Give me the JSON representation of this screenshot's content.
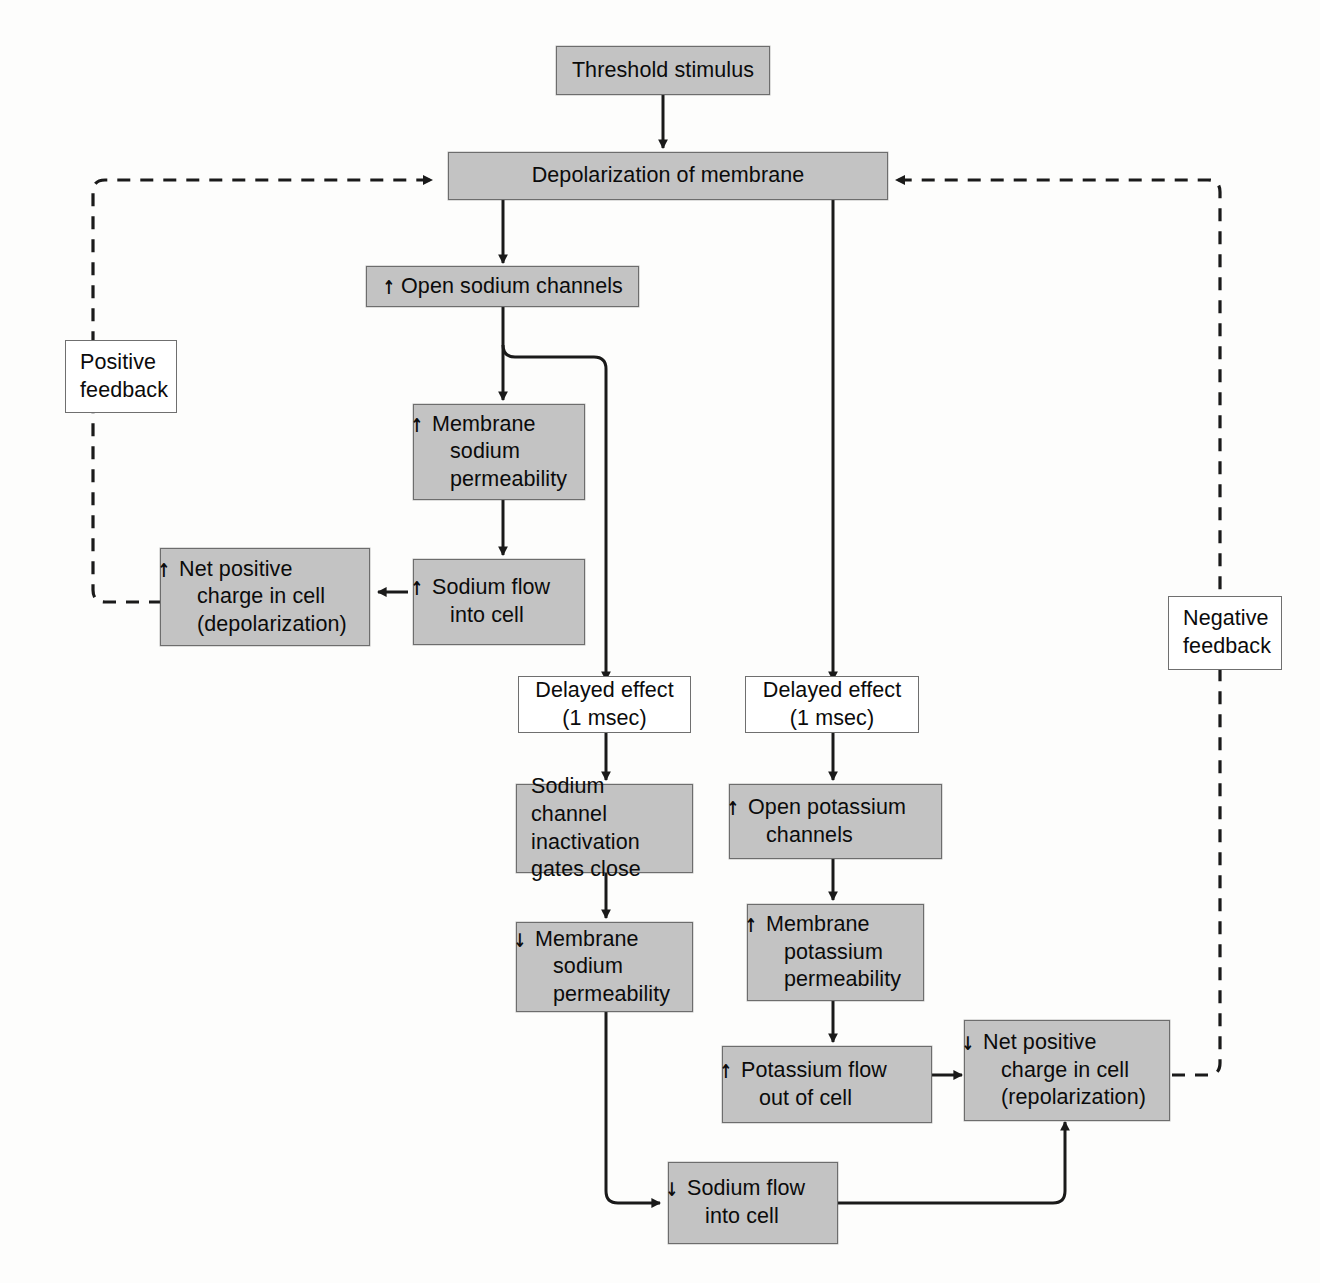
{
  "diagram": {
    "colors": {
      "box_fill": "#c3c3c3",
      "box_border": "#6d6d6d",
      "plain_fill": "#ffffff",
      "line": "#1a1a1a",
      "background": "#fdfdfc"
    },
    "glyphs": {
      "increase": "↑",
      "decrease": "↓"
    },
    "nodes": [
      {
        "id": "threshold",
        "label": "Threshold stimulus",
        "arrow": "",
        "style": "filled",
        "align": "center"
      },
      {
        "id": "depolarization",
        "label": "Depolarization of membrane",
        "arrow": "",
        "style": "filled",
        "align": "center"
      },
      {
        "id": "open_na",
        "label": "Open sodium channels",
        "arrow": "↑",
        "style": "filled",
        "align": "left"
      },
      {
        "id": "pos_feedback",
        "label": "Positive\nfeedback",
        "arrow": "",
        "style": "plain",
        "align": "left"
      },
      {
        "id": "neg_feedback",
        "label": "Negative\nfeedback",
        "arrow": "",
        "style": "plain",
        "align": "left"
      },
      {
        "id": "mem_na_perm_up",
        "label": "Membrane\nsodium\npermeability",
        "arrow": "↑",
        "style": "filled",
        "align": "left"
      },
      {
        "id": "na_flow_in_up",
        "label": "Sodium flow\ninto cell",
        "arrow": "↑",
        "style": "filled",
        "align": "left"
      },
      {
        "id": "net_pos_depol",
        "label": "Net positive\ncharge in cell\n(depolarization)",
        "arrow": "↑",
        "style": "filled",
        "align": "left"
      },
      {
        "id": "delay_left",
        "label": "Delayed effect\n(1 msec)",
        "arrow": "",
        "style": "plain",
        "align": "center"
      },
      {
        "id": "delay_right",
        "label": "Delayed effect\n(1 msec)",
        "arrow": "",
        "style": "plain",
        "align": "center"
      },
      {
        "id": "na_inactivation",
        "label": "Sodium channel\ninactivation\ngates close",
        "arrow": "",
        "style": "filled",
        "align": "left"
      },
      {
        "id": "open_k",
        "label": "Open potassium\nchannels",
        "arrow": "↑",
        "style": "filled",
        "align": "left"
      },
      {
        "id": "mem_na_perm_down",
        "label": "Membrane\nsodium\npermeability",
        "arrow": "↓",
        "style": "filled",
        "align": "left"
      },
      {
        "id": "mem_k_perm_up",
        "label": "Membrane\npotassium\npermeability",
        "arrow": "↑",
        "style": "filled",
        "align": "left"
      },
      {
        "id": "k_flow_out",
        "label": "Potassium flow\nout of cell",
        "arrow": "↑",
        "style": "filled",
        "align": "left"
      },
      {
        "id": "net_pos_repol",
        "label": "Net positive\ncharge in cell\n(repolarization)",
        "arrow": "↓",
        "style": "filled",
        "align": "left"
      },
      {
        "id": "na_flow_in_down",
        "label": "Sodium flow\ninto cell",
        "arrow": "↓",
        "style": "filled",
        "align": "left"
      }
    ],
    "edges": [
      {
        "from": "threshold",
        "to": "depolarization",
        "style": "solid"
      },
      {
        "from": "depolarization",
        "to": "open_na",
        "style": "solid"
      },
      {
        "from": "depolarization",
        "to": "delay_right",
        "style": "solid"
      },
      {
        "from": "open_na",
        "to": "mem_na_perm_up",
        "style": "solid"
      },
      {
        "from": "open_na",
        "to": "delay_left",
        "style": "solid"
      },
      {
        "from": "mem_na_perm_up",
        "to": "na_flow_in_up",
        "style": "solid"
      },
      {
        "from": "na_flow_in_up",
        "to": "net_pos_depol",
        "style": "solid"
      },
      {
        "from": "net_pos_depol",
        "to": "depolarization",
        "style": "dashed",
        "label": "Positive feedback"
      },
      {
        "from": "delay_left",
        "to": "na_inactivation",
        "style": "solid"
      },
      {
        "from": "delay_right",
        "to": "open_k",
        "style": "solid"
      },
      {
        "from": "na_inactivation",
        "to": "mem_na_perm_down",
        "style": "solid"
      },
      {
        "from": "open_k",
        "to": "mem_k_perm_up",
        "style": "solid"
      },
      {
        "from": "mem_na_perm_down",
        "to": "na_flow_in_down",
        "style": "solid"
      },
      {
        "from": "mem_k_perm_up",
        "to": "k_flow_out",
        "style": "solid"
      },
      {
        "from": "k_flow_out",
        "to": "net_pos_repol",
        "style": "solid"
      },
      {
        "from": "na_flow_in_down",
        "to": "net_pos_repol",
        "style": "solid"
      },
      {
        "from": "net_pos_repol",
        "to": "depolarization",
        "style": "dashed",
        "label": "Negative feedback"
      }
    ]
  }
}
